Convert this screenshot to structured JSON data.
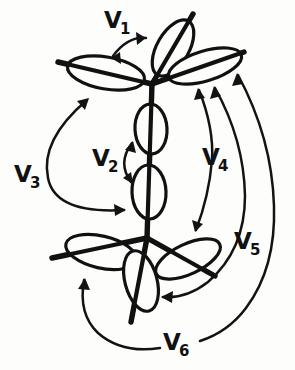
{
  "figure": {
    "background_color": "#fdfdfb",
    "ink_color": "#111111",
    "width": 295,
    "height": 370
  },
  "labels": {
    "v1": {
      "base": "V",
      "sub": "1"
    },
    "v2": {
      "base": "V",
      "sub": "2"
    },
    "v3": {
      "base": "V",
      "sub": "3"
    },
    "v4": {
      "base": "V",
      "sub": "4"
    },
    "v5": {
      "base": "V",
      "sub": "5"
    },
    "v6": {
      "base": "V",
      "sub": "6"
    }
  },
  "structure": {
    "description": "Two bonded centers drawn as intersecting stick bonds, each bond capped by an elongated elliptical orbital lobe.",
    "centers": [
      {
        "name": "upper-center",
        "x": 152,
        "y": 82
      },
      {
        "name": "lower-center",
        "x": 147,
        "y": 238
      }
    ],
    "lobes": [
      {
        "name": "upper-axial-lobe",
        "cx": 172,
        "cy": 48,
        "angle": -60
      },
      {
        "name": "upper-left-lobe",
        "cx": 107,
        "cy": 72,
        "angle": 10
      },
      {
        "name": "upper-right-lobe",
        "cx": 203,
        "cy": 65,
        "angle": -17
      },
      {
        "name": "bond-upper-lobe",
        "cx": 150,
        "cy": 128,
        "angle": 90
      },
      {
        "name": "bond-lower-lobe",
        "cx": 149,
        "cy": 190,
        "angle": 90
      },
      {
        "name": "lower-left-lobe",
        "cx": 103,
        "cy": 253,
        "angle": 12
      },
      {
        "name": "lower-right-lobe",
        "cx": 190,
        "cy": 258,
        "angle": -24
      },
      {
        "name": "lower-axial-lobe",
        "cx": 141,
        "cy": 280,
        "angle": 74
      }
    ]
  },
  "annotations": [
    {
      "id": "v1",
      "label": "V1",
      "arrow_type": "double-headed",
      "relation": "angle between upper axial lobe and upper left lobe"
    },
    {
      "id": "v2",
      "label": "V2",
      "arrow_type": "double-headed",
      "relation": "angle across the two central bond lobes"
    },
    {
      "id": "v3",
      "label": "V3",
      "arrow_type": "double-headed",
      "relation": "upper left lobe to lower left lobe"
    },
    {
      "id": "v4",
      "label": "V4",
      "arrow_type": "double-headed",
      "relation": "upper right lobe to lower right lobe"
    },
    {
      "id": "v5",
      "label": "V5",
      "arrow_type": "double-headed",
      "relation": "upper right lobe to lower axial region"
    },
    {
      "id": "v6",
      "label": "V6",
      "arrow_type": "double-headed",
      "relation": "upper right lobe around to lower left lobe"
    }
  ]
}
